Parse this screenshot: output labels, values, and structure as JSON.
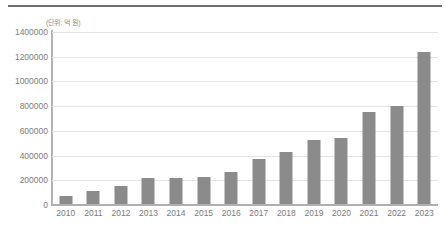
{
  "figure": {
    "unit_note": "(단위: 억 원)",
    "top_rule_color": "#6e6e6e",
    "bar_color": "#8b8b8b",
    "grid_color": "#e3e3e3",
    "axis_color": "#b0b0b0",
    "label_color": "#7a7a7a"
  },
  "chart_data": {
    "type": "bar",
    "title": "",
    "subtitle": "",
    "xlabel": "",
    "ylabel": "",
    "annotations": [
      "(단위: 억 원)"
    ],
    "legend": [],
    "legend_position": "none",
    "grid": true,
    "ylim": [
      0,
      1400000
    ],
    "ytick_values": [
      0,
      200000,
      400000,
      600000,
      800000,
      1000000,
      1200000,
      1400000
    ],
    "ytick_labels": [
      "0",
      "200000",
      "400000",
      "600000",
      "800000",
      "1000000",
      "1200000",
      "1400000"
    ],
    "categories": [
      "2010",
      "2011",
      "2012",
      "2013",
      "2014",
      "2015",
      "2016",
      "2017",
      "2018",
      "2019",
      "2020",
      "2021",
      "2022",
      "2023"
    ],
    "values": [
      75000,
      110000,
      150000,
      215000,
      215000,
      225000,
      265000,
      370000,
      430000,
      530000,
      540000,
      755000,
      800000,
      1240000
    ]
  }
}
